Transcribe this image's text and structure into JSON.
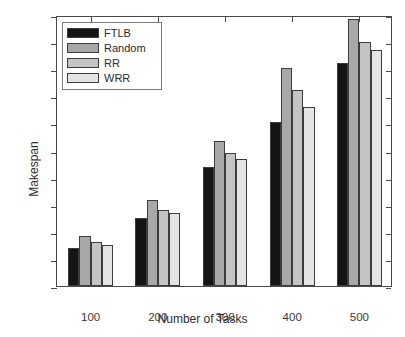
{
  "chart_data": {
    "type": "bar",
    "title": "",
    "subtitle": "",
    "xlabel": "Number of Tasks",
    "ylabel": "Makespan",
    "categories": [
      "100",
      "200",
      "300",
      "400",
      "500"
    ],
    "series": [
      {
        "name": "FTLB",
        "color": "#151515",
        "values": [
          70,
          125,
          219,
          303,
          412
        ]
      },
      {
        "name": "Random",
        "color": "#a8a8a8",
        "values": [
          92,
          158,
          267,
          403,
          493
        ]
      },
      {
        "name": "RR",
        "color": "#c4c4c4",
        "values": [
          82,
          141,
          246,
          362,
          450
        ]
      },
      {
        "name": "WRR",
        "color": "#e4e4e4",
        "values": [
          76,
          134,
          234,
          331,
          435
        ]
      }
    ],
    "ylim": [
      0,
      500
    ],
    "ytick_values": [
      0,
      50,
      100,
      150,
      200,
      250,
      300,
      350,
      400,
      450,
      500
    ],
    "ytick_labels": [
      "0",
      "50",
      "100",
      "150",
      "200",
      "250",
      "300",
      "350",
      "400",
      "450",
      "500"
    ],
    "xtick_labels": [
      "100",
      "200",
      "300",
      "400",
      "500"
    ],
    "grid": false,
    "legend_position": "upper-left",
    "legend_entries": [
      "FTLB",
      "Random",
      "RR",
      "WRR"
    ],
    "annotations": []
  }
}
